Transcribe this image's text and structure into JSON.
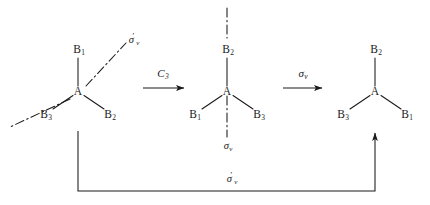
{
  "diagram": {
    "stroke_color": "#1a1a1a",
    "background_color": "#ffffff"
  },
  "molecules": [
    {
      "id": "molecule-left",
      "center_label": "A",
      "top_label": "B",
      "top_sub": "1",
      "left_label": "B",
      "left_sub": "3",
      "right_label": "B",
      "right_sub": "2",
      "mirror_label": "σ",
      "mirror_prime": "′",
      "mirror_sub": "v"
    },
    {
      "id": "molecule-middle",
      "center_label": "A",
      "top_label": "B",
      "top_sub": "2",
      "left_label": "B",
      "left_sub": "1",
      "right_label": "B",
      "right_sub": "3",
      "mirror_label": "σ",
      "mirror_prime": "",
      "mirror_sub": "v"
    },
    {
      "id": "molecule-right",
      "center_label": "A",
      "top_label": "B",
      "top_sub": "2",
      "left_label": "B",
      "left_sub": "3",
      "right_label": "B",
      "right_sub": "1",
      "mirror_label": "",
      "mirror_prime": "",
      "mirror_sub": ""
    }
  ],
  "operations": [
    {
      "id": "op-c3",
      "symbol": "C",
      "sub": "3",
      "prime": "",
      "direction": "right"
    },
    {
      "id": "op-sigma-v",
      "symbol": "σ",
      "sub": "v",
      "prime": "",
      "direction": "right"
    },
    {
      "id": "op-sigma-v-prime",
      "symbol": "σ",
      "sub": "v",
      "prime": "′",
      "direction": "up"
    }
  ]
}
